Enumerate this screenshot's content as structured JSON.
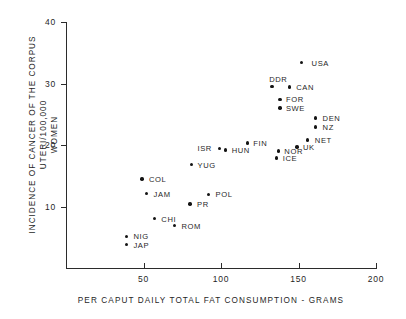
{
  "chart_data": {
    "type": "scatter",
    "title": "",
    "xlabel": "PER CAPUT DAILY TOTAL FAT CONSUMPTION - GRAMS",
    "ylabel_line1": "INCIDENCE OF CANCER OF THE CORPUS UTERI/100,000",
    "ylabel_line2": "WOMEN",
    "xlim": [
      0,
      200
    ],
    "ylim": [
      0,
      40
    ],
    "xticks": [
      "50",
      "100",
      "150",
      "200"
    ],
    "xtick_values": [
      50,
      100,
      150,
      200
    ],
    "yticks": [
      "10",
      "20",
      "30",
      "40"
    ],
    "ytick_values": [
      10,
      20,
      30,
      40
    ],
    "grid": false,
    "legend": "none",
    "points": [
      {
        "label": "USA",
        "x": 152,
        "y": 33.4,
        "lx": 10,
        "ly": -4
      },
      {
        "label": "DDR",
        "x": 133,
        "y": 29.5,
        "lx": -3,
        "ly": -12
      },
      {
        "label": "CAN",
        "x": 144,
        "y": 29.4,
        "lx": 7,
        "ly": -4
      },
      {
        "label": "FOR",
        "x": 138,
        "y": 27.4,
        "lx": 6,
        "ly": -4
      },
      {
        "label": "SWE",
        "x": 138,
        "y": 26.0,
        "lx": 6,
        "ly": -4
      },
      {
        "label": "DEN",
        "x": 161,
        "y": 24.4,
        "lx": 7,
        "ly": -4
      },
      {
        "label": "NZ",
        "x": 161,
        "y": 22.9,
        "lx": 7,
        "ly": -4
      },
      {
        "label": "NET",
        "x": 156,
        "y": 20.8,
        "lx": 7,
        "ly": -4
      },
      {
        "label": "UK",
        "x": 149,
        "y": 19.7,
        "lx": 6,
        "ly": -4
      },
      {
        "label": "NOR",
        "x": 137,
        "y": 19.0,
        "lx": 6,
        "ly": -4
      },
      {
        "label": "ICE",
        "x": 136,
        "y": 17.9,
        "lx": 6,
        "ly": -4
      },
      {
        "label": "FIN",
        "x": 117,
        "y": 20.3,
        "lx": 6,
        "ly": -4
      },
      {
        "label": "HUN",
        "x": 103,
        "y": 19.2,
        "lx": 6,
        "ly": -4
      },
      {
        "label": "ISR",
        "x": 99,
        "y": 19.4,
        "lx": -22,
        "ly": -5
      },
      {
        "label": "YUG",
        "x": 81,
        "y": 16.8,
        "lx": 6,
        "ly": -4
      },
      {
        "label": "COL",
        "x": 49,
        "y": 14.5,
        "lx": 7,
        "ly": -4
      },
      {
        "label": "JAM",
        "x": 52,
        "y": 12.1,
        "lx": 7,
        "ly": -4
      },
      {
        "label": "POL",
        "x": 92,
        "y": 12.0,
        "lx": 7,
        "ly": -4
      },
      {
        "label": "PR",
        "x": 80,
        "y": 10.4,
        "lx": 7,
        "ly": -4
      },
      {
        "label": "CHI",
        "x": 57,
        "y": 8.0,
        "lx": 7,
        "ly": -4
      },
      {
        "label": "ROM",
        "x": 70,
        "y": 6.9,
        "lx": 7,
        "ly": -4
      },
      {
        "label": "NIG",
        "x": 39,
        "y": 5.1,
        "lx": 7,
        "ly": -5
      },
      {
        "label": "JAP",
        "x": 39,
        "y": 3.8,
        "lx": 7,
        "ly": -4
      }
    ]
  }
}
